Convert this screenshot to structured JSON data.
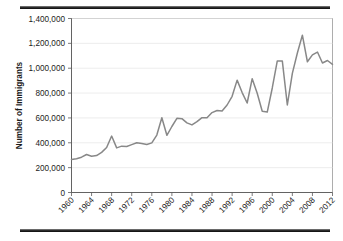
{
  "figure": {
    "top_rule": "horizontal-rule",
    "bottom_rule": "horizontal-rule"
  },
  "chart_data": {
    "type": "line",
    "title": "",
    "xlabel": "",
    "ylabel": "Number of Immigrants",
    "xlim": [
      1960,
      2012
    ],
    "ylim": [
      0,
      1400000
    ],
    "grid": true,
    "legend": false,
    "line_color": "#888888",
    "y_ticks": [
      0,
      200000,
      400000,
      600000,
      800000,
      1000000,
      1200000,
      1400000
    ],
    "y_tick_labels": [
      "0",
      "200,000",
      "400,000",
      "600,000",
      "800,000",
      "1,000,000",
      "1,200,000",
      "1,400,000"
    ],
    "x_ticks": [
      1960,
      1964,
      1968,
      1972,
      1976,
      1980,
      1984,
      1988,
      1992,
      1996,
      2000,
      2004,
      2008,
      2012
    ],
    "x_tick_labels": [
      "1960",
      "1964",
      "1968",
      "1972",
      "1976",
      "1980",
      "1984",
      "1988",
      "1992",
      "1996",
      "2000",
      "2004",
      "2008",
      "2012"
    ],
    "series": [
      {
        "name": "Immigrants admitted",
        "x": [
          1960,
          1961,
          1962,
          1963,
          1964,
          1965,
          1966,
          1967,
          1968,
          1969,
          1970,
          1971,
          1972,
          1973,
          1974,
          1975,
          1976,
          1977,
          1978,
          1979,
          1980,
          1981,
          1982,
          1983,
          1984,
          1985,
          1986,
          1987,
          1988,
          1989,
          1990,
          1991,
          1992,
          1993,
          1994,
          1995,
          1996,
          1997,
          1998,
          1999,
          2000,
          2001,
          2002,
          2003,
          2004,
          2005,
          2006,
          2007,
          2008,
          2009,
          2010,
          2011,
          2012
        ],
        "values": [
          265000,
          271000,
          284000,
          306000,
          292000,
          297000,
          323000,
          362000,
          454000,
          359000,
          373000,
          370000,
          385000,
          400000,
          395000,
          386000,
          399000,
          462000,
          601000,
          460000,
          531000,
          597000,
          594000,
          560000,
          544000,
          570000,
          602000,
          602000,
          643000,
          660000,
          656000,
          704000,
          774000,
          904000,
          804000,
          720000,
          916000,
          798000,
          654000,
          647000,
          841000,
          1059000,
          1059000,
          704000,
          958000,
          1122000,
          1266000,
          1052000,
          1107000,
          1130000,
          1042000,
          1062000,
          1031000
        ]
      }
    ]
  }
}
